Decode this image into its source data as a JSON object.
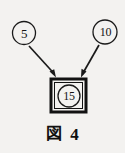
{
  "figure": {
    "background_color": "#f3f2f0",
    "ink_color": "#141414",
    "caption": {
      "word": "図",
      "number": "4"
    },
    "nodes": {
      "input_a": {
        "label": "5",
        "shape": "circle",
        "cx": 24,
        "cy": 33,
        "r": 11.5
      },
      "input_b": {
        "label": "10",
        "shape": "circle",
        "cx": 105,
        "cy": 32,
        "r": 12
      },
      "output": {
        "label": "15",
        "shape": "circle-in-square",
        "cx": 69,
        "cy": 96,
        "r": 11.5,
        "box": {
          "x": 50,
          "y": 78,
          "w": 37,
          "h": 35
        }
      }
    },
    "arrows": [
      {
        "name": "arrow-from-input-a",
        "x1": 29,
        "y1": 46,
        "x2": 56,
        "y2": 76
      },
      {
        "name": "arrow-from-input-b",
        "x1": 99,
        "y1": 45,
        "x2": 81,
        "y2": 76
      }
    ]
  }
}
